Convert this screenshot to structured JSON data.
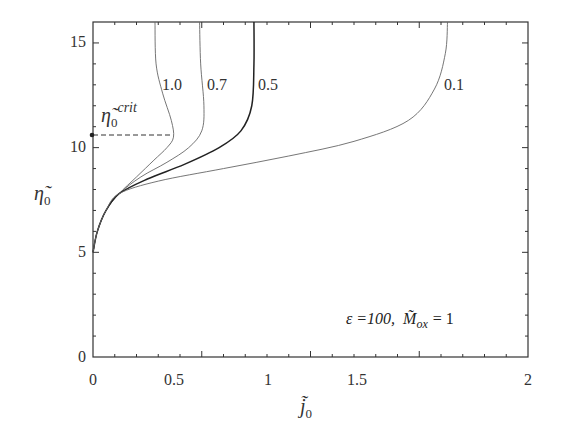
{
  "chart_data": {
    "type": "line",
    "title": "",
    "xlabel": "j̃₀",
    "ylabel": "η̃₀",
    "xlim": [
      0,
      2
    ],
    "ylim": [
      0,
      16
    ],
    "xticks": [
      "0",
      "0.5",
      "1",
      "1.5",
      "2"
    ],
    "yticks": [
      "0",
      "5",
      "10",
      "15"
    ],
    "grid": false,
    "legend": "inline curve labels",
    "annotation": "ε =100,  M̃ox = 1",
    "critical_label": "η̃₀crit",
    "critical_value": 10.5,
    "series": [
      {
        "name": "1.0",
        "x": [
          0.0,
          0.02,
          0.06,
          0.12,
          0.2,
          0.28,
          0.34,
          0.37,
          0.36,
          0.32,
          0.29,
          0.285
        ],
        "y": [
          5.0,
          6.0,
          7.0,
          7.8,
          8.6,
          9.4,
          10.0,
          10.5,
          11.3,
          12.6,
          14.0,
          16.0
        ]
      },
      {
        "name": "0.7",
        "x": [
          0.0,
          0.02,
          0.06,
          0.12,
          0.22,
          0.34,
          0.44,
          0.5,
          0.51,
          0.495,
          0.49
        ],
        "y": [
          5.0,
          6.0,
          7.0,
          7.8,
          8.6,
          9.3,
          10.0,
          10.8,
          12.0,
          14.0,
          16.0
        ]
      },
      {
        "name": "0.5",
        "x": [
          0.0,
          0.02,
          0.06,
          0.12,
          0.25,
          0.42,
          0.58,
          0.68,
          0.73,
          0.74,
          0.74
        ],
        "y": [
          5.0,
          6.0,
          7.0,
          7.8,
          8.5,
          9.2,
          10.0,
          10.8,
          12.0,
          14.0,
          16.0
        ]
      },
      {
        "name": "0.1",
        "x": [
          0.0,
          0.02,
          0.06,
          0.12,
          0.3,
          0.6,
          0.9,
          1.2,
          1.45,
          1.57,
          1.62,
          1.63
        ],
        "y": [
          5.0,
          6.0,
          7.0,
          7.8,
          8.4,
          9.0,
          9.6,
          10.3,
          11.3,
          12.8,
          14.5,
          16.0
        ]
      }
    ]
  },
  "labels": {
    "y_axis": "η̃",
    "y_axis_sub": "0",
    "x_axis": "j̃",
    "x_axis_sub": "0",
    "crit_main": "η̃",
    "crit_sub": "0",
    "crit_sup": "crit",
    "annot_eps": "ε =100,",
    "annot_M": "M̃",
    "annot_M_sub": "ox",
    "annot_eq": "= 1",
    "tick_x": [
      "0",
      "0.5",
      "1",
      "1.5",
      "2"
    ],
    "tick_y": [
      "0",
      "5",
      "10",
      "15"
    ],
    "curve_labels": [
      "1.0",
      "0.7",
      "0.5",
      "0.1"
    ]
  }
}
